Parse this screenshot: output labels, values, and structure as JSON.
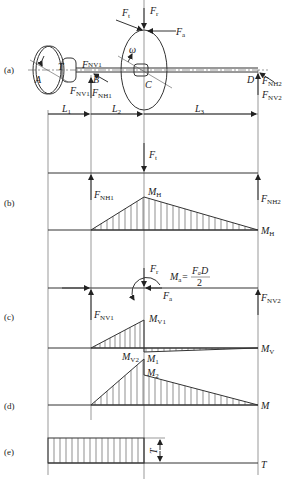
{
  "panels": {
    "a": "(a)",
    "b": "(b)",
    "c": "(c)",
    "d": "(d)",
    "e": "(e)"
  },
  "points": {
    "A": "A",
    "B": "B",
    "C": "C",
    "D": "D",
    "T": "T",
    "omega": "ω"
  },
  "forces": {
    "Ft": {
      "main": "F",
      "sub": "t"
    },
    "Fr": {
      "main": "F",
      "sub": "r"
    },
    "Fa": {
      "main": "F",
      "sub": "a"
    },
    "FNV1": {
      "main": "F",
      "sub": "NV1"
    },
    "FNH1": {
      "main": "F",
      "sub": "NH1"
    },
    "FNH2": {
      "main": "F",
      "sub": "NH2"
    },
    "FNV2": {
      "main": "F",
      "sub": "NV2"
    }
  },
  "dimensions": {
    "L1": {
      "main": "L",
      "sub": "1"
    },
    "L2": {
      "main": "L",
      "sub": "2"
    },
    "L3": {
      "main": "L",
      "sub": "3"
    }
  },
  "moments": {
    "MH": {
      "main": "M",
      "sub": "H"
    },
    "MV": {
      "main": "M",
      "sub": "V"
    },
    "MV1": {
      "main": "M",
      "sub": "V1"
    },
    "MV2": {
      "main": "M",
      "sub": "V2"
    },
    "M1": {
      "main": "M",
      "sub": "1"
    },
    "M2": {
      "main": "M",
      "sub": "2"
    },
    "M": "M",
    "T": "T",
    "Ma_formula": {
      "lhs_main": "M",
      "lhs_sub": "a",
      "eq": "=",
      "num": "FₐD",
      "den": "2"
    }
  }
}
